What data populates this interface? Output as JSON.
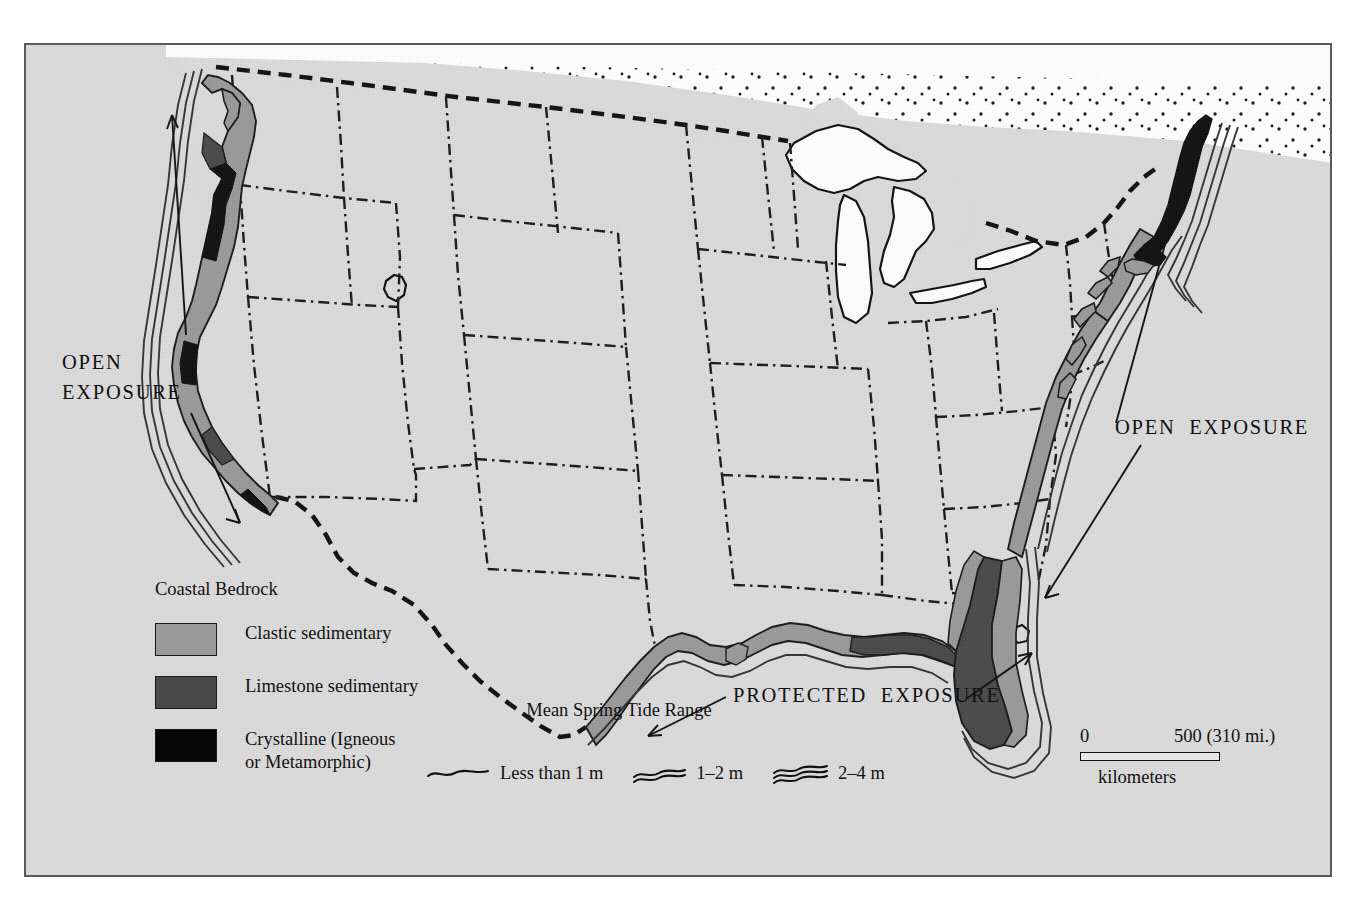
{
  "figure": {
    "background_color": "#dcdcdc",
    "frame_color": "#5a5a5a",
    "page_color": "#ffffff"
  },
  "annotations": {
    "open_exposure_west": "OPEN\nEXPOSURE",
    "open_exposure_east": "OPEN  EXPOSURE",
    "protected_exposure": "PROTECTED  EXPOSURE"
  },
  "legend_bedrock": {
    "title": "Coastal Bedrock",
    "items": [
      {
        "label": "Clastic sedimentary",
        "color": "#9a9a9a",
        "key": "clastic-sedimentary"
      },
      {
        "label": "Limestone sedimentary",
        "color": "#4a4a4a",
        "key": "limestone-sedimentary"
      },
      {
        "label": "Crystalline (Igneous\nor Metamorphic)",
        "color": "#050505",
        "key": "crystalline"
      }
    ]
  },
  "legend_tide": {
    "title": "Mean Spring Tide Range",
    "items": [
      {
        "label": "Less than 1 m",
        "lines": 1,
        "key": "tide-less-than-1m"
      },
      {
        "label": "1–2 m",
        "lines": 2,
        "key": "tide-1-2m"
      },
      {
        "label": "2–4 m",
        "lines": 3,
        "key": "tide-2-4m"
      }
    ]
  },
  "scale": {
    "min": "0",
    "max": "500 (310 mi.)",
    "unit": "kilometers",
    "bar_length_km": 500,
    "bar_length_mi": 310
  },
  "map_features": {
    "country_border_style": "dashed",
    "state_border_style": "dash-dot",
    "canada_fill": "stippled",
    "great_lakes_fill": "white",
    "coast_bands": [
      "clastic sedimentary (light gray)",
      "limestone sedimentary (dark gray)",
      "crystalline igneous or metamorphic (black)"
    ],
    "tide_lines_note": "Offshore parallel wavy lines indicate mean spring tide range class"
  }
}
